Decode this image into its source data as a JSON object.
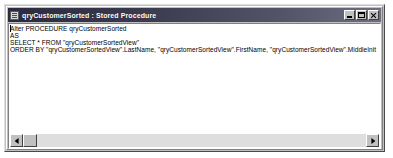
{
  "window": {
    "title": "qryCustomerSorted : Stored Procedure",
    "icon": "stored-procedure-icon",
    "colors": {
      "titlebar_start": "#2b2b3f",
      "titlebar_end": "#6e6e82",
      "window_face": "#c0c0c0",
      "editor_background": "#ffffff",
      "text": "#000000"
    },
    "buttons": {
      "minimize_label": "_",
      "maximize_label": "□",
      "close_label": "×"
    }
  },
  "editor": {
    "lines": [
      "Alter PROCEDURE qryCustomerSorted",
      "AS",
      "SELECT * FROM \"qryCustomerSortedView\"",
      "ORDER BY \"qryCustomerSortedView\".LastName, \"qryCustomerSortedView\".FirstName, \"qryCustomerSortedView\".MiddleInit"
    ]
  },
  "scrollbar": {
    "left_arrow": "◄",
    "right_arrow": "►",
    "thumb_position": 0
  }
}
